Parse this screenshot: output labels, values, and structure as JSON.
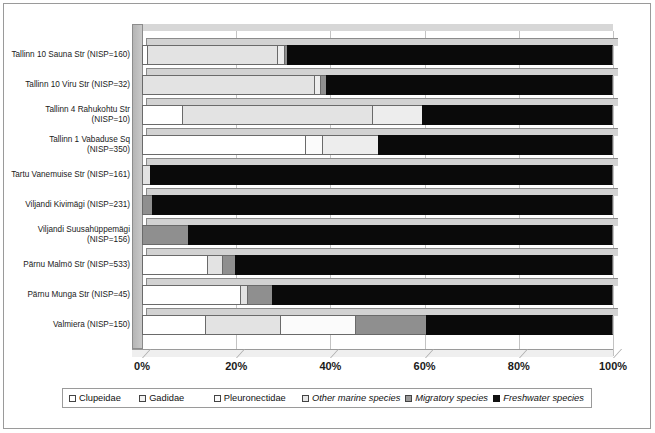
{
  "chart_data": {
    "type": "bar",
    "orientation": "horizontal",
    "stacked": true,
    "normalized_percent": true,
    "title": "",
    "xlabel": "",
    "ylabel": "",
    "xlim": [
      0,
      100
    ],
    "grid": true,
    "legend_position": "bottom",
    "xticks": [
      "0%",
      "20%",
      "40%",
      "60%",
      "80%",
      "100%"
    ],
    "xtick_values": [
      0,
      20,
      40,
      60,
      80,
      100
    ],
    "categories": [
      "Tallinn 10 Sauna Str (NISP=160)",
      "Tallinn 10 Viru Str (NISP=32)",
      "Tallinn 4 Rahukohtu Str (NISP=10)",
      "Tallinn 1 Vabaduse Sq (NISP=350)",
      "Tartu Vanemuise Str (NISP=161)",
      "Viljandi Kivimägi (NISP=231)",
      "Viljandi Suusahüppemägi (NISP=156)",
      "Pärnu Malmö Str (NISP=533)",
      "Pärnu Munga Str (NISP=45)",
      "Valmiera (NISP=150)"
    ],
    "category_lines": [
      [
        "Tallinn 10 Sauna Str (NISP=160)"
      ],
      [
        "Tallinn 10 Viru Str (NISP=32)"
      ],
      [
        "Tallinn 4 Rahukohtu Str",
        "(NISP=10)"
      ],
      [
        "Tallinn 1 Vabaduse Sq",
        "(NISP=350)"
      ],
      [
        "Tartu Vanemuise Str (NISP=161)"
      ],
      [
        "Viljandi Kivimägi (NISP=231)"
      ],
      [
        "Viljandi Suusahüppemägi",
        "(NISP=156)"
      ],
      [
        "Pärnu Malmö Str (NISP=533)"
      ],
      [
        "Pärnu Munga Str (NISP=45)"
      ],
      [
        "Valmiera (NISP=150)"
      ]
    ],
    "series": [
      {
        "name": "Clupeidae",
        "values": [
          1.0,
          0.0,
          8.5,
          34.7,
          0.0,
          0.0,
          0.0,
          13.8,
          20.8,
          13.4
        ]
      },
      {
        "name": "Gadidae",
        "values": [
          27.6,
          36.5,
          40.4,
          0.0,
          1.7,
          0.0,
          0.0,
          3.2,
          1.5,
          16.0
        ]
      },
      {
        "name": "Pleuronectidae",
        "values": [
          0.0,
          0.0,
          0.0,
          3.6,
          0.0,
          0.0,
          0.0,
          0.0,
          0.0,
          15.9
        ]
      },
      {
        "name": "Other marine species",
        "values": [
          1.6,
          1.3,
          10.6,
          11.9,
          0.0,
          0.0,
          0.0,
          0.0,
          0.0,
          0.0
        ]
      },
      {
        "name": "Migratory species",
        "values": [
          0.6,
          1.2,
          0.0,
          0.0,
          0.0,
          2.1,
          9.8,
          2.8,
          5.3,
          14.9
        ]
      },
      {
        "name": "Freshwater species",
        "values": [
          69.2,
          61.0,
          40.5,
          49.8,
          98.3,
          97.9,
          90.2,
          80.2,
          72.4,
          39.8
        ]
      }
    ],
    "legend": [
      {
        "label": "Clupeidae",
        "style": "normal",
        "swatch": "s0"
      },
      {
        "label": "Gadidae",
        "style": "normal",
        "swatch": "s1"
      },
      {
        "label": "Pleuronectidae",
        "style": "normal",
        "swatch": "s2"
      },
      {
        "label": "Other marine species",
        "style": "italic",
        "swatch": "s3"
      },
      {
        "label": "Migratory species",
        "style": "italic",
        "swatch": "s4"
      },
      {
        "label": "Freshwater species",
        "style": "italic",
        "swatch": "s5"
      }
    ],
    "colors": {
      "Clupeidae": "#ffffff",
      "Gadidae": "#e3e3e3",
      "Pleuronectidae": "#fbfbfb",
      "Other marine species": "#ededed",
      "Migratory species": "#8f8f8f",
      "Freshwater species": "#0a0a0a",
      "frame": "#9a9a9a",
      "gridline": "#c3c3c3"
    }
  }
}
